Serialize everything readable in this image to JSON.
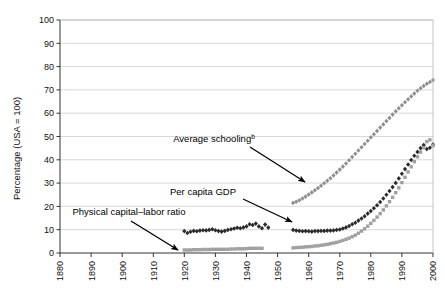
{
  "chart_data": {
    "type": "scatter",
    "title": "",
    "xlabel": "",
    "ylabel": "Percentage (USA = 100)",
    "xlim": [
      1880,
      2000
    ],
    "ylim": [
      0,
      100
    ],
    "xticks": [
      1880,
      1890,
      1900,
      1910,
      1920,
      1930,
      1940,
      1950,
      1960,
      1970,
      1980,
      1990,
      2000
    ],
    "yticks": [
      0,
      10,
      20,
      30,
      40,
      50,
      60,
      70,
      80,
      90,
      100
    ],
    "grid": "horizontal",
    "legend_position": "none",
    "annotations": [
      {
        "name": "average-schooling",
        "text": "Average schooling",
        "superscript": "b",
        "label_x": 214,
        "label_y": 142,
        "arrow_from": [
          250,
          147
        ],
        "arrow_to": [
          305,
          182
        ]
      },
      {
        "name": "per-capita-gdp",
        "text": "Per capita GDP",
        "superscript": "",
        "label_x": 203,
        "label_y": 195,
        "arrow_from": [
          243,
          199
        ],
        "arrow_to": [
          292,
          222
        ]
      },
      {
        "name": "physical-capital-labor-ratio",
        "text": "Physical capital–labor ratio",
        "superscript": "",
        "label_x": 129,
        "label_y": 215,
        "arrow_from": [
          131,
          221
        ],
        "arrow_to": [
          178,
          250
        ]
      }
    ],
    "series": [
      {
        "name": "Average schooling",
        "marker": "diamond",
        "color": "#8f8f8f",
        "points": [
          [
            1955,
            21.5
          ],
          [
            1956,
            22.0
          ],
          [
            1957,
            22.6
          ],
          [
            1958,
            23.4
          ],
          [
            1959,
            24.2
          ],
          [
            1960,
            25.1
          ],
          [
            1961,
            26.0
          ],
          [
            1962,
            26.9
          ],
          [
            1963,
            27.9
          ],
          [
            1964,
            28.9
          ],
          [
            1965,
            29.9
          ],
          [
            1966,
            31.0
          ],
          [
            1967,
            32.1
          ],
          [
            1968,
            33.3
          ],
          [
            1969,
            34.5
          ],
          [
            1970,
            35.8
          ],
          [
            1971,
            37.1
          ],
          [
            1972,
            38.4
          ],
          [
            1973,
            39.8
          ],
          [
            1974,
            41.2
          ],
          [
            1975,
            42.6
          ],
          [
            1976,
            44.0
          ],
          [
            1977,
            45.4
          ],
          [
            1978,
            46.8
          ],
          [
            1979,
            48.2
          ],
          [
            1980,
            49.6
          ],
          [
            1981,
            51.0
          ],
          [
            1982,
            52.4
          ],
          [
            1983,
            53.8
          ],
          [
            1984,
            55.2
          ],
          [
            1985,
            56.6
          ],
          [
            1986,
            58.0
          ],
          [
            1987,
            59.4
          ],
          [
            1988,
            60.8
          ],
          [
            1989,
            62.1
          ],
          [
            1990,
            63.4
          ],
          [
            1991,
            64.7
          ],
          [
            1992,
            66.0
          ],
          [
            1993,
            67.2
          ],
          [
            1994,
            68.4
          ],
          [
            1995,
            69.6
          ],
          [
            1996,
            70.7
          ],
          [
            1997,
            71.7
          ],
          [
            1998,
            72.6
          ],
          [
            1999,
            73.4
          ],
          [
            2000,
            74.2
          ]
        ]
      },
      {
        "name": "Per capita GDP",
        "marker": "diamond",
        "color": "#2b2b2b",
        "points": [
          [
            1920,
            9.4
          ],
          [
            1921,
            8.6
          ],
          [
            1922,
            9.1
          ],
          [
            1923,
            9.5
          ],
          [
            1924,
            9.3
          ],
          [
            1925,
            9.6
          ],
          [
            1926,
            9.8
          ],
          [
            1927,
            9.7
          ],
          [
            1928,
            9.9
          ],
          [
            1929,
            10.2
          ],
          [
            1930,
            9.8
          ],
          [
            1931,
            9.4
          ],
          [
            1932,
            9.2
          ],
          [
            1933,
            9.5
          ],
          [
            1934,
            9.9
          ],
          [
            1935,
            10.2
          ],
          [
            1936,
            10.5
          ],
          [
            1937,
            10.8
          ],
          [
            1938,
            10.6
          ],
          [
            1939,
            11.0
          ],
          [
            1940,
            11.4
          ],
          [
            1941,
            12.3
          ],
          [
            1942,
            12.0
          ],
          [
            1943,
            12.6
          ],
          [
            1944,
            11.4
          ],
          [
            1945,
            10.6
          ],
          [
            1946,
            12.2
          ],
          [
            1947,
            10.9
          ],
          [
            1955,
            9.9
          ],
          [
            1956,
            9.6
          ],
          [
            1957,
            9.5
          ],
          [
            1958,
            9.3
          ],
          [
            1959,
            9.4
          ],
          [
            1960,
            9.3
          ],
          [
            1961,
            9.2
          ],
          [
            1962,
            9.4
          ],
          [
            1963,
            9.4
          ],
          [
            1964,
            9.5
          ],
          [
            1965,
            9.5
          ],
          [
            1966,
            9.6
          ],
          [
            1967,
            9.6
          ],
          [
            1968,
            9.7
          ],
          [
            1969,
            9.9
          ],
          [
            1970,
            10.1
          ],
          [
            1971,
            10.5
          ],
          [
            1972,
            11.0
          ],
          [
            1973,
            11.6
          ],
          [
            1974,
            12.3
          ],
          [
            1975,
            13.0
          ],
          [
            1976,
            13.9
          ],
          [
            1977,
            14.8
          ],
          [
            1978,
            15.8
          ],
          [
            1979,
            16.9
          ],
          [
            1980,
            18.0
          ],
          [
            1981,
            19.2
          ],
          [
            1982,
            20.5
          ],
          [
            1983,
            21.9
          ],
          [
            1984,
            23.4
          ],
          [
            1985,
            25.0
          ],
          [
            1986,
            26.6
          ],
          [
            1987,
            28.3
          ],
          [
            1988,
            30.1
          ],
          [
            1989,
            32.0
          ],
          [
            1990,
            34.0
          ],
          [
            1991,
            36.0
          ],
          [
            1992,
            38.0
          ],
          [
            1993,
            39.9
          ],
          [
            1994,
            41.7
          ],
          [
            1995,
            43.4
          ],
          [
            1996,
            45.0
          ],
          [
            1997,
            46.3
          ],
          [
            1998,
            44.6
          ],
          [
            1999,
            45.2
          ],
          [
            2000,
            46.6
          ]
        ]
      },
      {
        "name": "Physical capital–labor ratio",
        "marker": "square",
        "color": "#a0a0a0",
        "points": [
          [
            1920,
            1.3
          ],
          [
            1921,
            1.3
          ],
          [
            1922,
            1.3
          ],
          [
            1923,
            1.4
          ],
          [
            1924,
            1.4
          ],
          [
            1925,
            1.4
          ],
          [
            1926,
            1.5
          ],
          [
            1927,
            1.5
          ],
          [
            1928,
            1.5
          ],
          [
            1929,
            1.6
          ],
          [
            1930,
            1.6
          ],
          [
            1931,
            1.6
          ],
          [
            1932,
            1.6
          ],
          [
            1933,
            1.6
          ],
          [
            1934,
            1.6
          ],
          [
            1935,
            1.7
          ],
          [
            1936,
            1.7
          ],
          [
            1937,
            1.8
          ],
          [
            1938,
            1.8
          ],
          [
            1939,
            1.8
          ],
          [
            1940,
            1.9
          ],
          [
            1941,
            2.0
          ],
          [
            1942,
            2.0
          ],
          [
            1943,
            2.0
          ],
          [
            1944,
            2.0
          ],
          [
            1945,
            2.0
          ],
          [
            1955,
            2.2
          ],
          [
            1956,
            2.3
          ],
          [
            1957,
            2.4
          ],
          [
            1958,
            2.5
          ],
          [
            1959,
            2.6
          ],
          [
            1960,
            2.7
          ],
          [
            1961,
            2.8
          ],
          [
            1962,
            3.0
          ],
          [
            1963,
            3.1
          ],
          [
            1964,
            3.3
          ],
          [
            1965,
            3.5
          ],
          [
            1966,
            3.7
          ],
          [
            1967,
            4.0
          ],
          [
            1968,
            4.3
          ],
          [
            1969,
            4.6
          ],
          [
            1970,
            5.0
          ],
          [
            1971,
            5.4
          ],
          [
            1972,
            5.9
          ],
          [
            1973,
            6.4
          ],
          [
            1974,
            7.0
          ],
          [
            1975,
            7.7
          ],
          [
            1976,
            8.5
          ],
          [
            1977,
            9.4
          ],
          [
            1978,
            10.4
          ],
          [
            1979,
            11.5
          ],
          [
            1980,
            12.7
          ],
          [
            1981,
            14.0
          ],
          [
            1982,
            15.4
          ],
          [
            1983,
            16.9
          ],
          [
            1984,
            18.5
          ],
          [
            1985,
            20.2
          ],
          [
            1986,
            22.0
          ],
          [
            1987,
            23.9
          ],
          [
            1988,
            25.9
          ],
          [
            1989,
            28.0
          ],
          [
            1990,
            30.2
          ],
          [
            1991,
            32.5
          ],
          [
            1992,
            34.8
          ],
          [
            1993,
            37.0
          ],
          [
            1994,
            39.2
          ],
          [
            1995,
            41.3
          ],
          [
            1996,
            43.3
          ],
          [
            1997,
            45.2
          ],
          [
            1998,
            47.8
          ],
          [
            1999,
            48.6
          ],
          [
            2000,
            46.0
          ]
        ]
      }
    ]
  },
  "axes": {
    "y_title": "Percentage (USA = 100)"
  }
}
